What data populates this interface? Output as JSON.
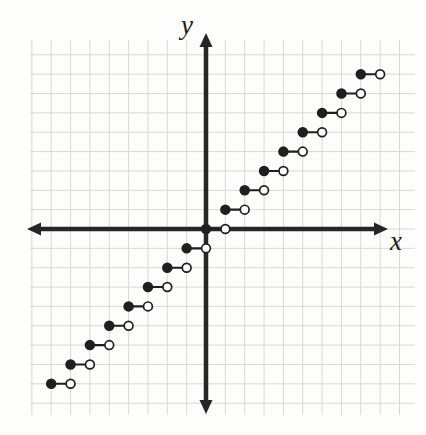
{
  "figure": {
    "title": "",
    "background_color": "#fdfdfc",
    "axis_color": "#262626",
    "grid_color": "#d8d8d6",
    "point_color": "#1f1f1f",
    "labels": {
      "x_axis": "x",
      "y_axis": "y"
    }
  },
  "geometry": {
    "origin_px": [
      206,
      229
    ],
    "unit_px": 19.35,
    "grid_left_px": 30,
    "grid_right_px": 415,
    "grid_top_px": 40,
    "grid_bottom_px": 415,
    "x_axis_y_px": 229,
    "y_axis_x_px": 206,
    "x_arrow_left_px": 27,
    "x_arrow_right_px": 388,
    "y_arrow_top_px": 33,
    "y_arrow_bottom_px": 414
  },
  "chart_data": {
    "type": "line",
    "subtype": "step-function",
    "title": "",
    "xlabel": "x",
    "ylabel": "y",
    "xlim": [
      -9.1,
      10.8
    ],
    "ylim": [
      -9.6,
      9.8
    ],
    "grid": true,
    "grid_step": 1,
    "legend": null,
    "segments": [
      {
        "y": -8,
        "x_start": -8,
        "x_end": -7,
        "left_endpoint": "closed",
        "right_endpoint": "open"
      },
      {
        "y": -7,
        "x_start": -7,
        "x_end": -6,
        "left_endpoint": "closed",
        "right_endpoint": "open"
      },
      {
        "y": -6,
        "x_start": -6,
        "x_end": -5,
        "left_endpoint": "closed",
        "right_endpoint": "open"
      },
      {
        "y": -5,
        "x_start": -5,
        "x_end": -4,
        "left_endpoint": "closed",
        "right_endpoint": "open"
      },
      {
        "y": -4,
        "x_start": -4,
        "x_end": -3,
        "left_endpoint": "closed",
        "right_endpoint": "open"
      },
      {
        "y": -3,
        "x_start": -3,
        "x_end": -2,
        "left_endpoint": "closed",
        "right_endpoint": "open"
      },
      {
        "y": -2,
        "x_start": -2,
        "x_end": -1,
        "left_endpoint": "closed",
        "right_endpoint": "open"
      },
      {
        "y": -1,
        "x_start": -1,
        "x_end": 0,
        "left_endpoint": "closed",
        "right_endpoint": "open"
      },
      {
        "y": 0,
        "x_start": 0,
        "x_end": 1,
        "left_endpoint": "closed",
        "right_endpoint": "open"
      },
      {
        "y": 1,
        "x_start": 1,
        "x_end": 2,
        "left_endpoint": "closed",
        "right_endpoint": "open"
      },
      {
        "y": 2,
        "x_start": 2,
        "x_end": 3,
        "left_endpoint": "closed",
        "right_endpoint": "open"
      },
      {
        "y": 3,
        "x_start": 3,
        "x_end": 4,
        "left_endpoint": "closed",
        "right_endpoint": "open"
      },
      {
        "y": 4,
        "x_start": 4,
        "x_end": 5,
        "left_endpoint": "closed",
        "right_endpoint": "open"
      },
      {
        "y": 5,
        "x_start": 5,
        "x_end": 6,
        "left_endpoint": "closed",
        "right_endpoint": "open"
      },
      {
        "y": 6,
        "x_start": 6,
        "x_end": 7,
        "left_endpoint": "closed",
        "right_endpoint": "open"
      },
      {
        "y": 7,
        "x_start": 7,
        "x_end": 8,
        "left_endpoint": "closed",
        "right_endpoint": "open"
      },
      {
        "y": 8,
        "x_start": 8,
        "x_end": 9,
        "left_endpoint": "closed",
        "right_endpoint": "open"
      }
    ],
    "xticks": [
      -9,
      -8,
      -7,
      -6,
      -5,
      -4,
      -3,
      -2,
      -1,
      0,
      1,
      2,
      3,
      4,
      5,
      6,
      7,
      8,
      9,
      10
    ],
    "yticks": [
      -9,
      -8,
      -7,
      -6,
      -5,
      -4,
      -3,
      -2,
      -1,
      0,
      1,
      2,
      3,
      4,
      5,
      6,
      7,
      8,
      9
    ],
    "xtick_labels": [],
    "ytick_labels": []
  }
}
